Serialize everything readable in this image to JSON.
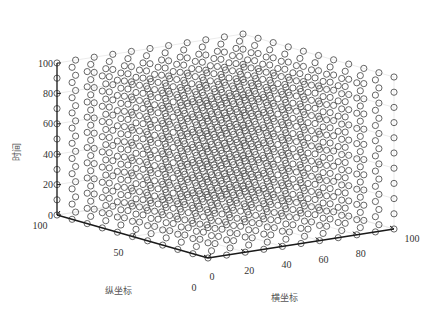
{
  "chart_data": {
    "type": "scatter3d",
    "title": "",
    "xlabel": "横坐标",
    "ylabel": "纵坐标",
    "zlabel": "时间",
    "xlim": [
      0,
      100
    ],
    "ylim": [
      0,
      100
    ],
    "zlim": [
      0,
      100
    ],
    "x_ticks": [
      0,
      20,
      40,
      60,
      80,
      100
    ],
    "y_ticks": [
      0,
      50,
      100
    ],
    "z_ticks": [
      0,
      20,
      40,
      60,
      80,
      100
    ],
    "grid": true,
    "marker": "open-circle",
    "marker_color": "#555555",
    "points_description": "Regular 3D lattice: x, y, z each from 0 to 100 in steps of 10",
    "x_values": [
      0,
      10,
      20,
      30,
      40,
      50,
      60,
      70,
      80,
      90,
      100
    ],
    "y_values": [
      0,
      10,
      20,
      30,
      40,
      50,
      60,
      70,
      80,
      90,
      100
    ],
    "z_values": [
      0,
      10,
      20,
      30,
      40,
      50,
      60,
      70,
      80,
      90,
      100
    ]
  },
  "axes": {
    "x_title": "横坐标",
    "y_title": "纵坐标",
    "z_title": "时间",
    "x_tick_labels": [
      "0",
      "20",
      "40",
      "60",
      "80",
      "100"
    ],
    "y_tick_labels": [
      "0",
      "50",
      "100"
    ],
    "z_tick_labels": [
      "0",
      "20",
      "40",
      "60",
      "80",
      "100"
    ]
  },
  "colors": {
    "axis": "#1a1a1a",
    "grid": "#e6e6e6",
    "marker": "#555555"
  }
}
